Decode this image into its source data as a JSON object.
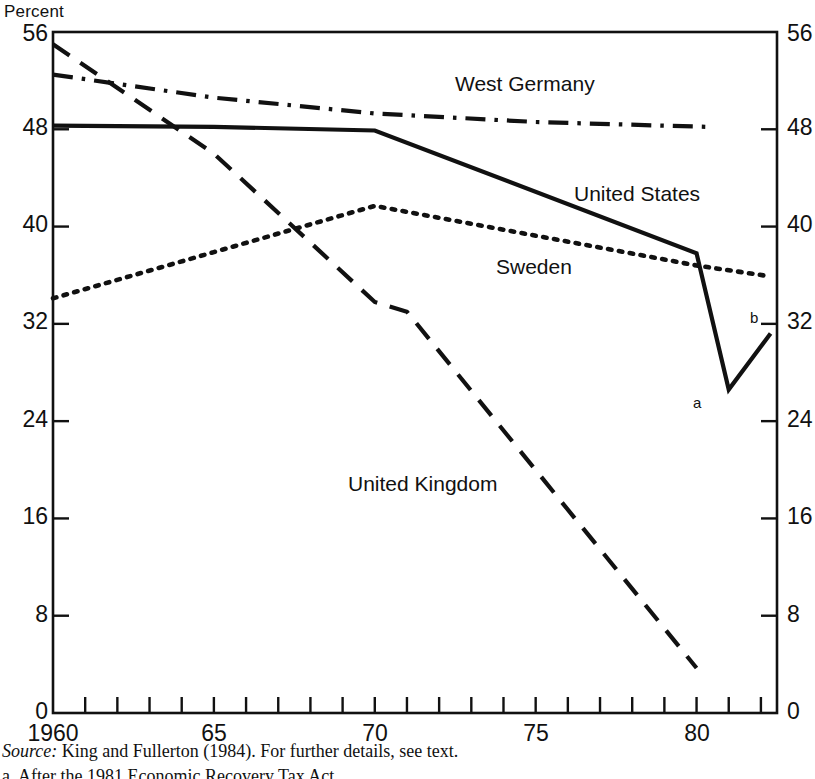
{
  "chart_data": {
    "type": "line",
    "title": "",
    "ylabel": "Percent",
    "xlabel": "",
    "ylim": [
      0,
      56
    ],
    "xlim": [
      1960,
      1982.5
    ],
    "yticks": [
      0,
      8,
      16,
      24,
      32,
      40,
      48,
      56
    ],
    "ytick_labels": [
      "0",
      "8",
      "16",
      "24",
      "32",
      "40",
      "48",
      "56"
    ],
    "xticks": [
      1960,
      1965,
      1970,
      1975,
      1980
    ],
    "xtick_labels": [
      "1960",
      "65",
      "70",
      "75",
      "80"
    ],
    "xtick_minor_step": 1,
    "grid": false,
    "legend": "inline-labels",
    "series": [
      {
        "name": "West Germany",
        "style": "dash-dot",
        "label_x": 1974.2,
        "label_y": 50.4,
        "x": [
          1960,
          1965,
          1970,
          1975,
          1980.3
        ],
        "y": [
          52.5,
          50.6,
          49.3,
          48.6,
          48.2
        ]
      },
      {
        "name": "United States",
        "style": "solid",
        "label_x": 1977.5,
        "label_y": 44.0,
        "x": [
          1960,
          1965,
          1970,
          1980,
          1981,
          1982.3
        ],
        "y": [
          48.3,
          48.2,
          47.9,
          37.8,
          26.6,
          31.2
        ]
      },
      {
        "name": "Sweden",
        "style": "dotted",
        "label_x": 1974.0,
        "label_y": 36.6,
        "x": [
          1960,
          1965,
          1970,
          1980,
          1982.3
        ],
        "y": [
          34.1,
          37.9,
          41.7,
          36.8,
          35.9
        ]
      },
      {
        "name": "United Kingdom",
        "style": "dashed",
        "label_x": 1970.2,
        "label_y": 15.2,
        "x": [
          1960,
          1965,
          1970,
          1971,
          1980
        ],
        "y": [
          55.0,
          46.0,
          33.8,
          33.0,
          3.7
        ]
      }
    ],
    "annotations": [
      {
        "text": "a",
        "x": 1981,
        "y": 26.6,
        "note": "after-1981-tax-act-marker"
      },
      {
        "text": "b",
        "x": 1982.3,
        "y": 31.2,
        "note": "end-point-marker"
      }
    ]
  },
  "notes": {
    "source_prefix": "Source:",
    "source_text": "King and Fullerton (1984). For further details, see text.",
    "footnote_a": "a. After the 1981 Economic Recovery Tax Act."
  },
  "colors": {
    "ink": "#111111",
    "background": "#ffffff"
  }
}
